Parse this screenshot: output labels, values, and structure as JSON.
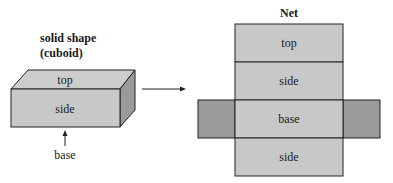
{
  "solid": {
    "title_line1": "solid shape",
    "title_line2": "(cuboid)",
    "top_label": "top",
    "side_label": "side",
    "base_label": "base"
  },
  "net": {
    "title": "Net",
    "faces": [
      "top",
      "side",
      "base",
      "side"
    ]
  },
  "colors": {
    "face_light": "#c8c8c8",
    "face_top": "#cdcdcd",
    "face_dark": "#9a9a9a",
    "stroke": "#222222"
  }
}
